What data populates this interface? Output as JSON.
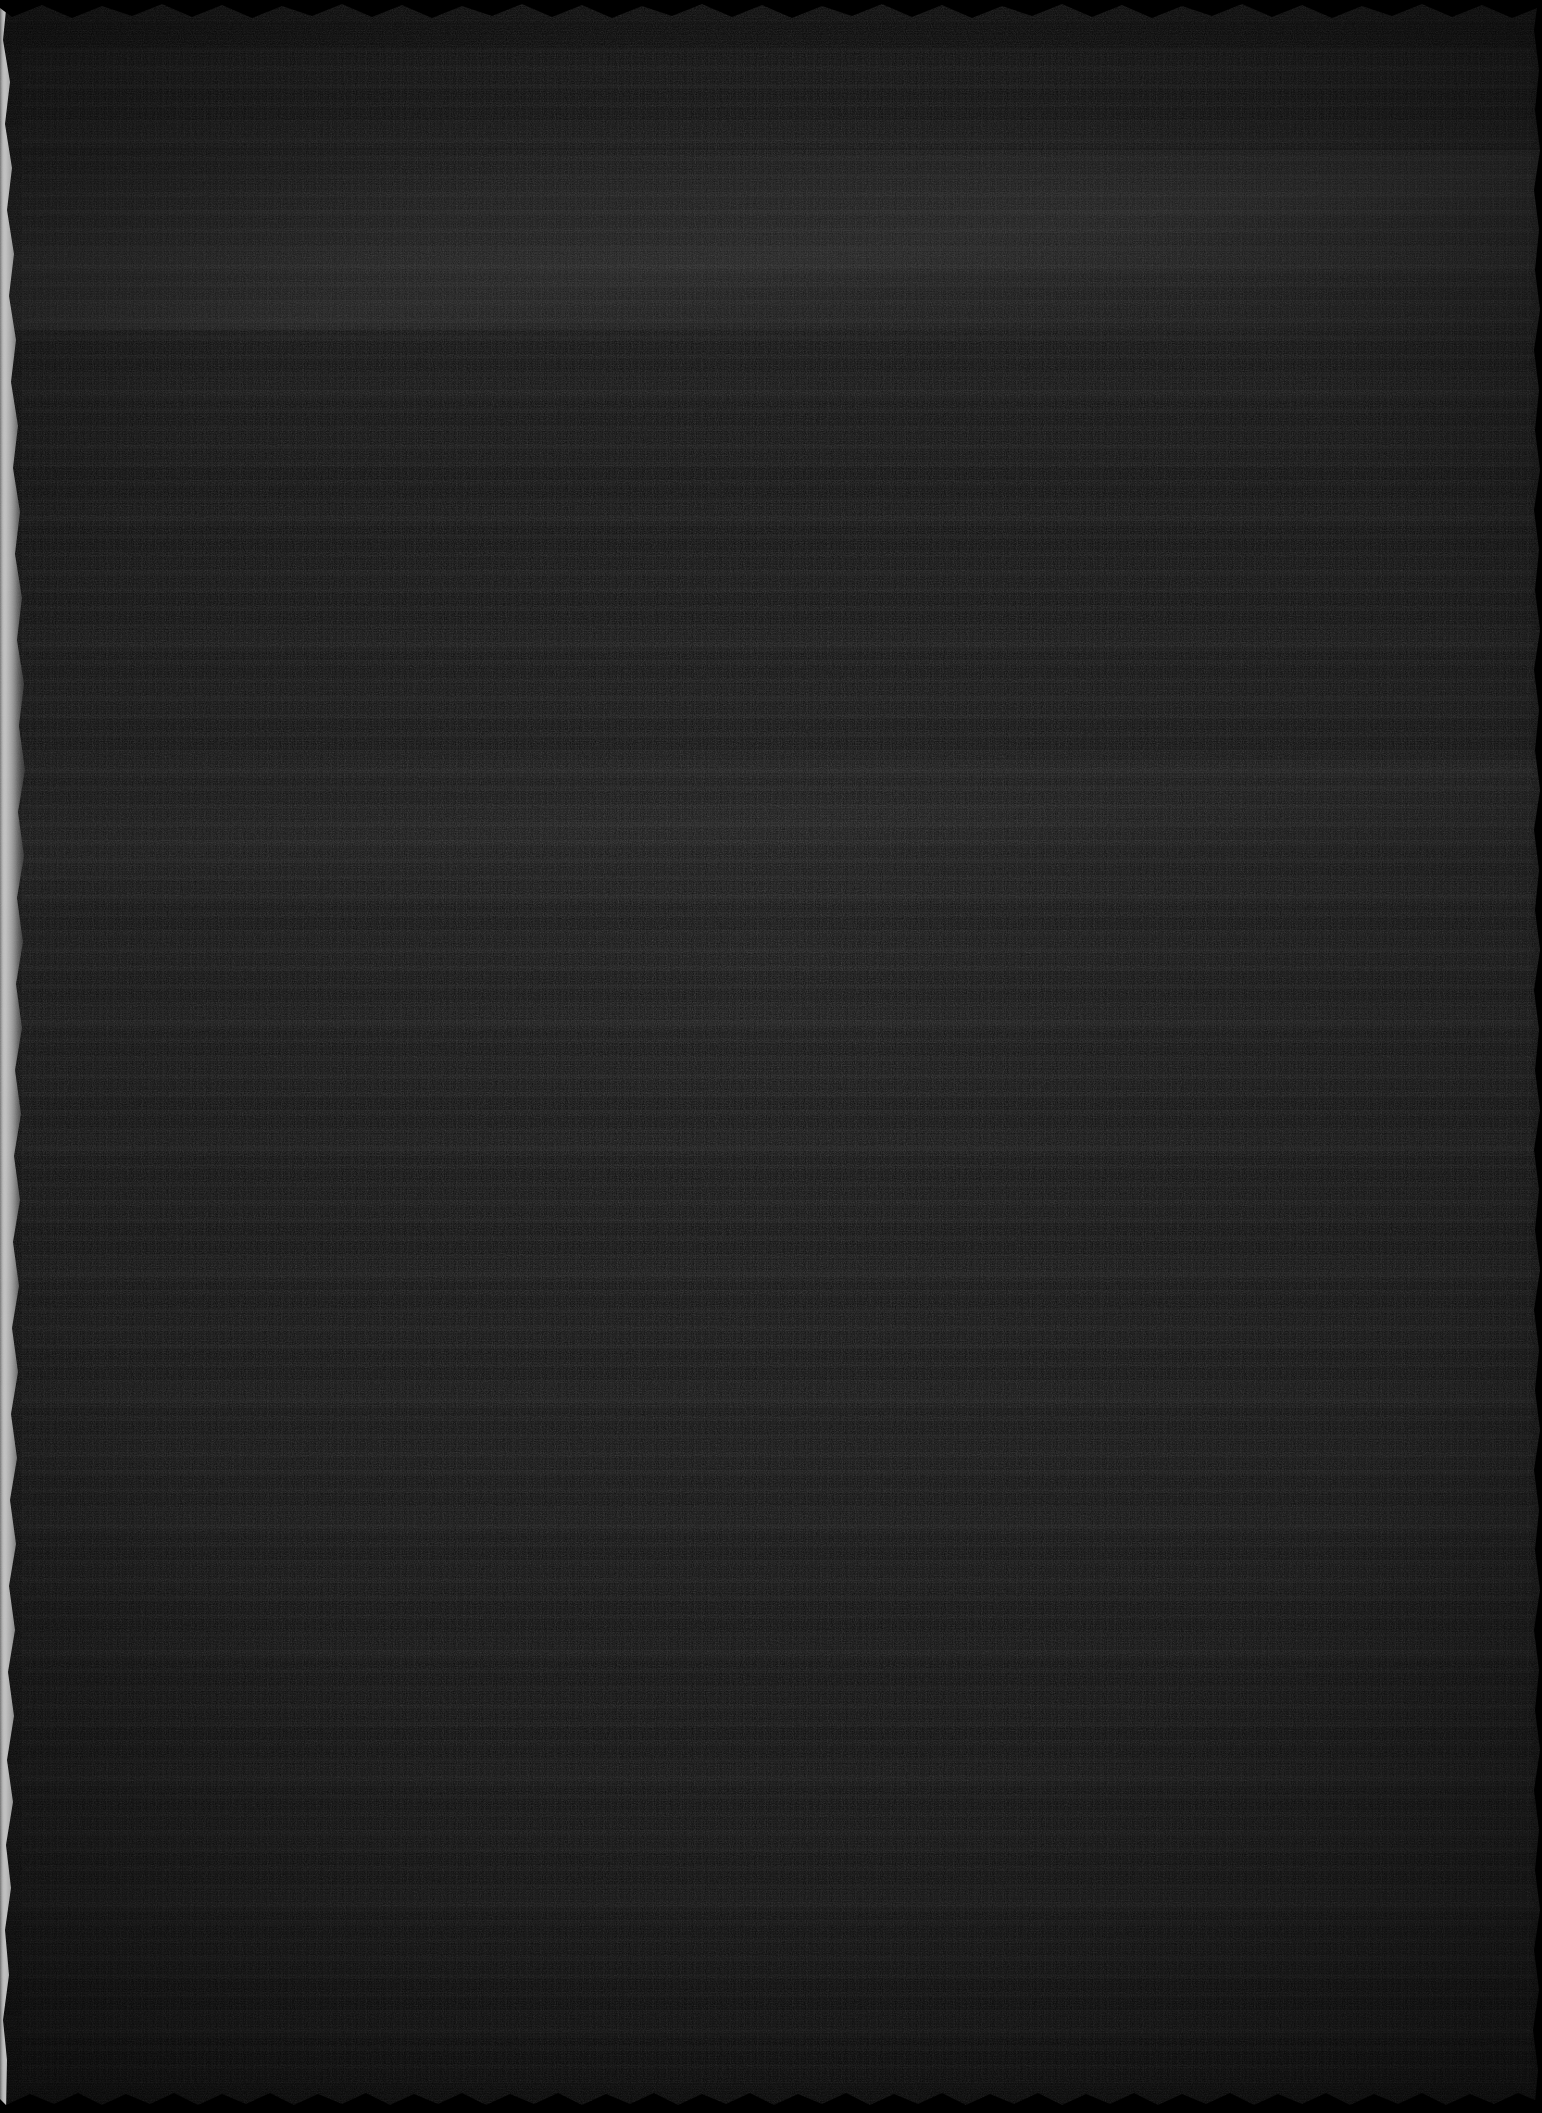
{
  "document": {
    "kind": "scanned-page",
    "legibility": "illegible",
    "description": "Severely underexposed scan of a document page. No text, icons, or interface controls are legible at any magnification.",
    "width_px": 1542,
    "height_px": 2113
  },
  "appearance": {
    "base_color": "#0b0b0b",
    "field_low": "#060606",
    "field_high": "#141414",
    "edge_highlight_color": "#d8d8d8",
    "vignette_color": "#000000"
  },
  "regions": {
    "paper_field": {
      "name": "paper-field",
      "note": "Near-black page body with faint horizontal banding"
    },
    "left_edge": {
      "name": "left-scan-edge",
      "note": "Ragged overexposed white/gray strip along the left margin, irregular width approx 0-25px"
    },
    "top_edge": {
      "name": "top-scallop",
      "note": "Scalloped dark boundary across the top"
    },
    "bottom_edge": {
      "name": "bottom-scallop",
      "note": "Scalloped dark boundary across the bottom"
    },
    "right_edge": {
      "name": "right-serration",
      "note": "Subtle serrated boundary along the right margin"
    },
    "fold_highlight": {
      "name": "fold-highlight",
      "note": "Faint lighter diagonal band suggesting a page fold or curl"
    },
    "text_ghost": {
      "name": "text-row-ghost",
      "note": "Faint horizontal rows of darker marks suggesting lines of text, none resolvable"
    }
  },
  "text_content": []
}
